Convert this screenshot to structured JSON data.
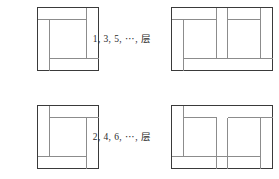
{
  "figure": {
    "type": "diagram",
    "background_color": "#ffffff",
    "line_color": "#3a3a3a",
    "line_color_light": "#8c8c8c",
    "rows": [
      {
        "id": "odd-layers",
        "label": "1, 3, 5, ⋯, 层",
        "left_figure_name": "square-pinwheel-odd",
        "right_figure_name": "double-pinwheel-odd"
      },
      {
        "id": "even-layers",
        "label": "2, 4, 6, ⋯, 层",
        "left_figure_name": "square-pinwheel-even",
        "right_figure_name": "double-pinwheel-even"
      }
    ]
  },
  "labels": {
    "odd": "1, 3, 5, ⋯, 层",
    "even": "2, 4, 6, ⋯, 层"
  }
}
